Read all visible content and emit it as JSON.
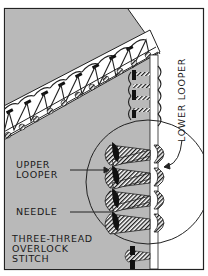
{
  "figure": {
    "title": "Three-thread overlock stitch",
    "colors": {
      "fabric_gray": "#b9b9b9",
      "background_white": "#ffffff",
      "ink": "#1a1a1a",
      "needle_thread": "#111111"
    }
  },
  "labels": {
    "lower_looper": "LOWER LOOPER",
    "upper_looper_line1": "UPPER",
    "upper_looper_line2": "LOOPER",
    "needle": "NEEDLE",
    "caption_line1": "THREE-THREAD",
    "caption_line2": "OVERLOCK",
    "caption_line3": "STITCH"
  }
}
